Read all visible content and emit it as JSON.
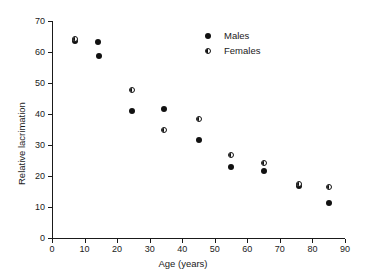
{
  "chart_data": {
    "type": "scatter",
    "title": "",
    "xlabel": "Age (years)",
    "ylabel": "Relative lacrimation",
    "xlim": [
      0,
      90
    ],
    "ylim": [
      0,
      70
    ],
    "xticks": [
      0,
      10,
      20,
      30,
      40,
      50,
      60,
      70,
      80,
      90
    ],
    "yticks": [
      0,
      10,
      20,
      30,
      40,
      50,
      60,
      70
    ],
    "grid": false,
    "legend_position": "upper right",
    "marker_color": "#111111",
    "series": [
      {
        "name": "Males",
        "marker": "filled-circle",
        "points": [
          {
            "x": 7,
            "y": 63.5
          },
          {
            "x": 14,
            "y": 63.3
          },
          {
            "x": 14.5,
            "y": 58.8
          },
          {
            "x": 24.5,
            "y": 41.0
          },
          {
            "x": 34.5,
            "y": 41.5
          },
          {
            "x": 45,
            "y": 31.5
          },
          {
            "x": 55,
            "y": 23.0
          },
          {
            "x": 65,
            "y": 21.7
          },
          {
            "x": 76,
            "y": 16.9
          },
          {
            "x": 85,
            "y": 11.2
          }
        ]
      },
      {
        "name": "Females",
        "marker": "half-filled-circle",
        "points": [
          {
            "x": 7,
            "y": 64.2
          },
          {
            "x": 24.5,
            "y": 47.8
          },
          {
            "x": 34.5,
            "y": 34.7
          },
          {
            "x": 45,
            "y": 38.5
          },
          {
            "x": 55,
            "y": 26.8
          },
          {
            "x": 65,
            "y": 24.3
          },
          {
            "x": 76,
            "y": 17.4
          },
          {
            "x": 85,
            "y": 16.6
          }
        ]
      }
    ]
  },
  "legend": {
    "entries": [
      {
        "label": "Males",
        "marker": "filled-circle"
      },
      {
        "label": "Females",
        "marker": "half-filled-circle"
      }
    ]
  }
}
